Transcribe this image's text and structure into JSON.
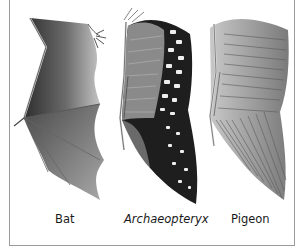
{
  "figure": {
    "panels": [
      {
        "id": "bat",
        "label": "Bat",
        "italic": false,
        "wing_type": "membrane-wing"
      },
      {
        "id": "archaeopteryx",
        "label": "Archaeopteryx",
        "italic": true,
        "wing_type": "spotted-feathered-wing"
      },
      {
        "id": "pigeon",
        "label": "Pigeon",
        "italic": false,
        "wing_type": "feathered-wing"
      }
    ]
  },
  "colors": {
    "background": "#ffffff",
    "frame": "#9a9a9a",
    "membrane_dark": "#3a3a3a",
    "membrane_light": "#bdbdbd",
    "feather_dark": "#1c1c1c",
    "feather_spot": "#f2f2f2",
    "feather_grey": "#8c8c8c"
  }
}
